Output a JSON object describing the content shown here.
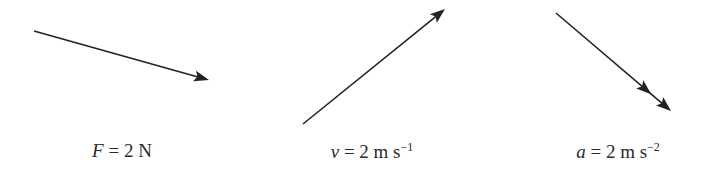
{
  "diagram": {
    "stroke_color": "#222222",
    "vectors": [
      {
        "id": "force",
        "symbol": "F",
        "equals": " = ",
        "value": "2",
        "unit": " N",
        "unit_exp": "",
        "start": [
          34,
          31
        ],
        "end": [
          209,
          80
        ],
        "arrowheads": 1,
        "label_x": 122
      },
      {
        "id": "velocity",
        "symbol": "v",
        "equals": " = ",
        "value": "2",
        "unit": " m s",
        "unit_exp": "−1",
        "start": [
          303,
          124
        ],
        "end": [
          445,
          9
        ],
        "arrowheads": 1,
        "label_x": 372
      },
      {
        "id": "acceleration",
        "symbol": "a",
        "equals": " = ",
        "value": "2",
        "unit": " m s",
        "unit_exp": "−2",
        "start": [
          556,
          13
        ],
        "end": [
          671,
          111
        ],
        "arrowheads": 2,
        "label_x": 618
      }
    ]
  }
}
